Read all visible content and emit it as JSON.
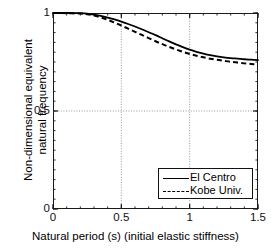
{
  "chart_data": {
    "type": "line",
    "title": "",
    "xlabel": "Natural period (s) (initial elastic stiffness)",
    "ylabel_line1": "Non-dimensional equivalent",
    "ylabel_line2": "natural frequency",
    "xlim": [
      0,
      1.5
    ],
    "ylim": [
      0,
      1
    ],
    "x_major_ticks": [
      0,
      0.5,
      1,
      1.5
    ],
    "x_major_tick_labels": [
      "0",
      "0.5",
      "1",
      "1.5"
    ],
    "x_minor_tick_step": 0.1,
    "y_major_ticks": [
      0,
      0.5,
      1
    ],
    "y_major_tick_labels": [
      "0",
      "0.5",
      "1"
    ],
    "y_minor_tick_step": 0.05,
    "grid": true,
    "gridlines_x": [
      0.5,
      1
    ],
    "gridlines_y": [
      0.5
    ],
    "grid_style": "dotted",
    "legend_position": "lower right",
    "series": [
      {
        "name": "El Centro",
        "style": "solid",
        "color": "#000000",
        "x": [
          0.0,
          0.1,
          0.2,
          0.25,
          0.3,
          0.35,
          0.4,
          0.45,
          0.5,
          0.55,
          0.6,
          0.65,
          0.7,
          0.75,
          0.8,
          0.85,
          0.9,
          0.95,
          1.0,
          1.05,
          1.1,
          1.15,
          1.2,
          1.25,
          1.3,
          1.35,
          1.4,
          1.45,
          1.5
        ],
        "y": [
          1.0,
          1.0,
          0.999,
          0.997,
          0.992,
          0.985,
          0.977,
          0.967,
          0.956,
          0.944,
          0.931,
          0.917,
          0.902,
          0.887,
          0.871,
          0.855,
          0.84,
          0.826,
          0.813,
          0.802,
          0.793,
          0.785,
          0.779,
          0.774,
          0.77,
          0.767,
          0.764,
          0.762,
          0.76
        ]
      },
      {
        "name": "Kobe Univ.",
        "style": "dashed",
        "color": "#000000",
        "x": [
          0.0,
          0.1,
          0.2,
          0.25,
          0.3,
          0.35,
          0.4,
          0.45,
          0.5,
          0.55,
          0.6,
          0.65,
          0.7,
          0.75,
          0.8,
          0.85,
          0.9,
          0.95,
          1.0,
          1.05,
          1.1,
          1.15,
          1.2,
          1.25,
          1.3,
          1.35,
          1.4,
          1.45,
          1.5
        ],
        "y": [
          1.0,
          0.999,
          0.997,
          0.994,
          0.987,
          0.977,
          0.965,
          0.951,
          0.936,
          0.92,
          0.904,
          0.888,
          0.872,
          0.856,
          0.841,
          0.827,
          0.814,
          0.802,
          0.791,
          0.782,
          0.774,
          0.767,
          0.761,
          0.756,
          0.751,
          0.747,
          0.743,
          0.74,
          0.737
        ]
      }
    ]
  },
  "axes": {
    "x_tick_labels": [
      "0",
      "0.5",
      "1",
      "1.5"
    ],
    "y_tick_labels": [
      "1",
      "0.5",
      "0"
    ],
    "xlabel": "Natural period (s) (initial elastic stiffness)",
    "ylabel_line1": "Non-dimensional equivalent",
    "ylabel_line2": "natural frequency"
  },
  "legend": {
    "entries": [
      {
        "label": "El Centro",
        "style": "solid"
      },
      {
        "label": "Kobe Univ.",
        "style": "dashed"
      }
    ]
  }
}
